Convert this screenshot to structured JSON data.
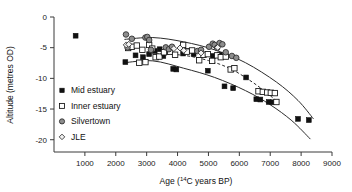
{
  "chart_data": {
    "type": "scatter",
    "title": "",
    "xlabel": "Age (14C years BP)",
    "xlabel_base": "Age (",
    "xlabel_sup": "14",
    "xlabel_tail": "C years BP)",
    "ylabel": "Altitude (metres OD)",
    "xlim": [
      0,
      9000
    ],
    "ylim": [
      -22,
      0
    ],
    "xticks": [
      1000,
      2000,
      3000,
      4000,
      5000,
      6000,
      7000,
      8000,
      9000
    ],
    "yticks": [
      0,
      -5,
      -10,
      -15,
      -20
    ],
    "xtick_labels": [
      "1000",
      "2000",
      "3000",
      "4000",
      "5000",
      "6000",
      "7000",
      "8000",
      "9000"
    ],
    "ytick_labels": [
      "0",
      "-5",
      "-10",
      "-15",
      "-20"
    ],
    "grid": false,
    "legend_position": "inside-left",
    "series": [
      {
        "name": "Mid estuary",
        "marker": "filled-square",
        "color": "#111111",
        "points": [
          [
            700,
            -3.05
          ],
          [
            2310,
            -7.35
          ],
          [
            2640,
            -6.25
          ],
          [
            2880,
            -6.55
          ],
          [
            3080,
            -6.05
          ],
          [
            3260,
            -5.55
          ],
          [
            3420,
            -5.25
          ],
          [
            3540,
            -6.35
          ],
          [
            3700,
            -5.35
          ],
          [
            3860,
            -8.45
          ],
          [
            3960,
            -8.55
          ],
          [
            4180,
            -5.95
          ],
          [
            4330,
            -5.55
          ],
          [
            4520,
            -6.05
          ],
          [
            4980,
            -8.75
          ],
          [
            5150,
            -6.35
          ],
          [
            5370,
            -6.15
          ],
          [
            5520,
            -11.3
          ],
          [
            5800,
            -11.6
          ],
          [
            6220,
            -9.85
          ],
          [
            6550,
            -13.4
          ],
          [
            6680,
            -13.45
          ],
          [
            6950,
            -13.85
          ],
          [
            7080,
            -13.9
          ],
          [
            7900,
            -16.6
          ],
          [
            8250,
            -16.8
          ]
        ]
      },
      {
        "name": "Inner estuary",
        "marker": "open-square",
        "color": "#ffffff",
        "points": [
          [
            2400,
            -5.05
          ],
          [
            2520,
            -4.85
          ],
          [
            2680,
            -4.65
          ],
          [
            2760,
            -7.45
          ],
          [
            2860,
            -5.35
          ],
          [
            2960,
            -7.35
          ],
          [
            3080,
            -4.55
          ],
          [
            3180,
            -5.15
          ],
          [
            3290,
            -6.55
          ],
          [
            3410,
            -6.45
          ],
          [
            3560,
            -5.75
          ],
          [
            3760,
            -5.65
          ],
          [
            3920,
            -6.15
          ],
          [
            4180,
            -4.55
          ],
          [
            4300,
            -5.65
          ],
          [
            4470,
            -5.45
          ],
          [
            4700,
            -7.05
          ],
          [
            4840,
            -6.15
          ],
          [
            4980,
            -6.05
          ],
          [
            5120,
            -7.15
          ],
          [
            5280,
            -6.25
          ],
          [
            5400,
            -6.55
          ],
          [
            5560,
            -6.45
          ],
          [
            5720,
            -8.55
          ],
          [
            5840,
            -8.35
          ],
          [
            6620,
            -12.1
          ],
          [
            6760,
            -12.2
          ],
          [
            6900,
            -12.3
          ],
          [
            7020,
            -12.35
          ],
          [
            7150,
            -12.4
          ],
          [
            7200,
            -13.85
          ]
        ]
      },
      {
        "name": "Silvertown",
        "marker": "filled-circle",
        "color": "#8d8d8d",
        "points": [
          [
            2330,
            -2.85
          ],
          [
            2380,
            -4.95
          ],
          [
            2520,
            -3.55
          ],
          [
            2960,
            -3.35
          ],
          [
            3020,
            -3.25
          ],
          [
            3080,
            -3.75
          ],
          [
            3140,
            -5.35
          ],
          [
            3620,
            -4.95
          ],
          [
            3720,
            -5.25
          ],
          [
            3820,
            -4.85
          ],
          [
            4640,
            -5.55
          ],
          [
            4760,
            -5.35
          ],
          [
            5020,
            -4.85
          ],
          [
            5140,
            -4.35
          ],
          [
            5200,
            -4.55
          ],
          [
            5280,
            -5.05
          ],
          [
            5360,
            -4.25
          ],
          [
            5450,
            -4.45
          ],
          [
            5560,
            -5.75
          ],
          [
            5760,
            -6.35
          ],
          [
            5900,
            -6.65
          ]
        ]
      },
      {
        "name": "JLE",
        "marker": "open-diamond",
        "color": "#f2f2f2",
        "points": [
          [
            2340,
            -4.55
          ],
          [
            2420,
            -4.45
          ],
          [
            3880,
            -5.15
          ],
          [
            4080,
            -5.05
          ],
          [
            4200,
            -5.45
          ],
          [
            4760,
            -5.85
          ],
          [
            5300,
            -4.95
          ]
        ]
      }
    ],
    "trend_curves": [
      {
        "name": "upper-bound-curve",
        "style": "solid",
        "points": [
          [
            2280,
            -3.65
          ],
          [
            3200,
            -3.35
          ],
          [
            4200,
            -4.05
          ],
          [
            5200,
            -5.35
          ],
          [
            6200,
            -7.45
          ],
          [
            7200,
            -10.6
          ],
          [
            7900,
            -13.6
          ],
          [
            8400,
            -16.6
          ]
        ]
      },
      {
        "name": "lower-bound-curve",
        "style": "solid",
        "points": [
          [
            2270,
            -7.45
          ],
          [
            3200,
            -7.15
          ],
          [
            4200,
            -8.35
          ],
          [
            5200,
            -9.85
          ],
          [
            6200,
            -12.0
          ],
          [
            7000,
            -14.3
          ],
          [
            7700,
            -16.9
          ],
          [
            8300,
            -19.9
          ]
        ]
      },
      {
        "name": "mean-trend-curve",
        "style": "dashed",
        "points": [
          [
            3300,
            -6.0
          ],
          [
            4200,
            -6.25
          ],
          [
            5000,
            -7.1
          ],
          [
            5700,
            -8.4
          ],
          [
            6300,
            -10.2
          ],
          [
            6800,
            -12.0
          ],
          [
            7250,
            -13.9
          ]
        ]
      }
    ]
  },
  "legend": {
    "items": [
      {
        "label": "Mid estuary",
        "marker": "filled-square"
      },
      {
        "label": "Inner estuary",
        "marker": "open-square"
      },
      {
        "label": "Silvertown",
        "marker": "filled-circle"
      },
      {
        "label": "JLE",
        "marker": "open-diamond"
      }
    ]
  }
}
